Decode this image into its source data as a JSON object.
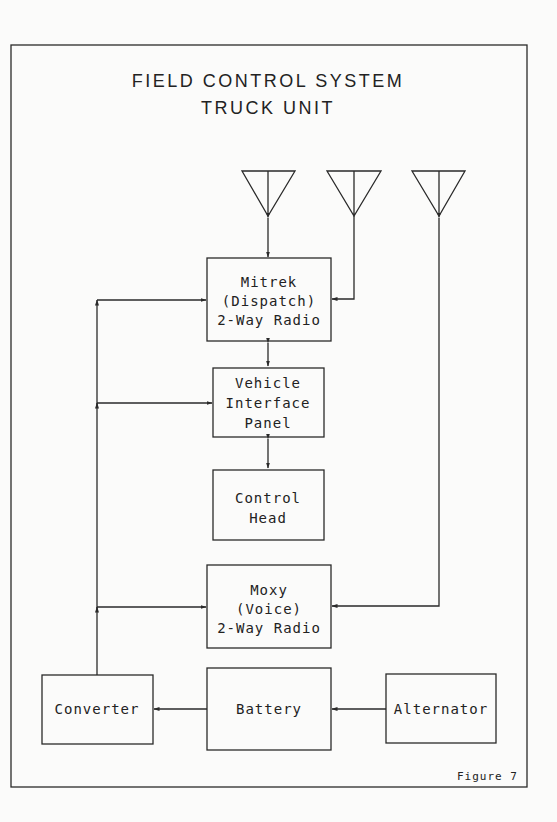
{
  "diagram": {
    "title_line1": "FIELD CONTROL SYSTEM",
    "title_line2": "TRUCK UNIT",
    "figure_label": "Figure 7",
    "antennas": [
      {
        "name": "antenna-1",
        "connects_to": "Mitrek (Dispatch) 2-Way Radio"
      },
      {
        "name": "antenna-2",
        "connects_to": "Mitrek (Dispatch) 2-Way Radio"
      },
      {
        "name": "antenna-3",
        "connects_to": "Moxy (Voice) 2-Way Radio"
      }
    ],
    "blocks": {
      "mitrek": {
        "lines": [
          "Mitrek",
          "(Dispatch)",
          "2-Way Radio"
        ]
      },
      "vip": {
        "lines": [
          "Vehicle",
          "Interface",
          "Panel"
        ]
      },
      "control_head": {
        "lines": [
          "Control",
          "Head"
        ]
      },
      "moxy": {
        "lines": [
          "Moxy",
          "(Voice)",
          "2-Way Radio"
        ]
      },
      "converter": {
        "lines": [
          "Converter"
        ]
      },
      "battery": {
        "lines": [
          "Battery"
        ]
      },
      "alternator": {
        "lines": [
          "Alternator"
        ]
      }
    },
    "connections": [
      {
        "from": "Alternator",
        "to": "Battery"
      },
      {
        "from": "Battery",
        "to": "Converter"
      },
      {
        "from": "Converter",
        "to": "Mitrek (Dispatch) 2-Way Radio"
      },
      {
        "from": "Converter",
        "to": "Vehicle Interface Panel"
      },
      {
        "from": "Converter",
        "to": "Moxy (Voice) 2-Way Radio"
      },
      {
        "from": "Mitrek (Dispatch) 2-Way Radio",
        "to": "Vehicle Interface Panel",
        "bidirectional": true
      },
      {
        "from": "Vehicle Interface Panel",
        "to": "Control Head",
        "bidirectional": true
      }
    ],
    "colors": {
      "line": "#2a2a2a",
      "background": "#fbfbfa"
    }
  }
}
